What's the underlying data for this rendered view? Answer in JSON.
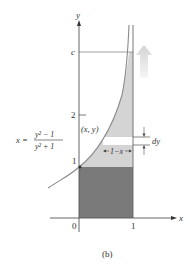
{
  "figure": {
    "caption": "(b)",
    "axes": {
      "x_label": "x",
      "y_label": "y",
      "origin_label": "0",
      "x_tick_1": "1",
      "y_tick_1": "1",
      "y_tick_2": "2",
      "y_tick_c": "c"
    },
    "curve_equation": {
      "lhs": "x =",
      "numerator": "y² − 1",
      "denominator": "y² + 1"
    },
    "point_label": "(x, y)",
    "strip_width_label": "1−x",
    "strip_height_label": "dy",
    "colors": {
      "dark_region": "#7a7a7a",
      "light_region": "#d4d4d4",
      "strip": "#ffffff",
      "curve": "#8a8a8a",
      "axis": "#555555",
      "arrow": "#e6e6e6"
    }
  }
}
